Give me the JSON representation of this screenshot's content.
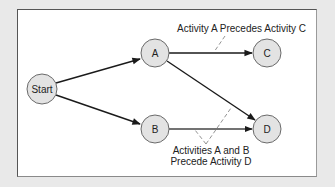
{
  "diagram": {
    "type": "activity-on-node precedence network",
    "nodes": [
      {
        "id": "start",
        "label": "Start",
        "cx": 42,
        "cy": 89,
        "r": 15
      },
      {
        "id": "a",
        "label": "A",
        "cx": 155,
        "cy": 53,
        "r": 14
      },
      {
        "id": "b",
        "label": "B",
        "cx": 155,
        "cy": 129,
        "r": 14
      },
      {
        "id": "c",
        "label": "C",
        "cx": 267,
        "cy": 53,
        "r": 14
      },
      {
        "id": "d",
        "label": "D",
        "cx": 267,
        "cy": 129,
        "r": 14
      }
    ],
    "edges": [
      {
        "from": "Start",
        "to": "A"
      },
      {
        "from": "Start",
        "to": "B"
      },
      {
        "from": "A",
        "to": "C"
      },
      {
        "from": "A",
        "to": "D"
      },
      {
        "from": "B",
        "to": "D"
      }
    ],
    "annotations": {
      "a_precedes_c": "Activity A Precedes Activity C",
      "ab_precede_d_line1": "Activities A and B",
      "ab_precede_d_line2": "Precede Activity D"
    }
  }
}
